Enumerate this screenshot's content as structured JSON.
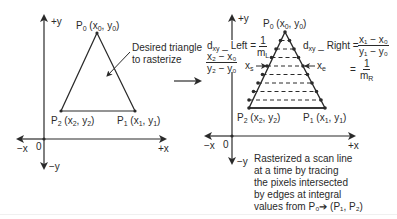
{
  "left_diagram": {
    "axis_labels": {
      "pos_y": "+y",
      "neg_y": "−y",
      "pos_x": "+x",
      "neg_x": "−x",
      "origin": "0"
    },
    "points": {
      "p0": {
        "name": "P",
        "index": "0",
        "coords_prefix": "(x",
        "coords_mid": ", y",
        "coords_suffix": ")"
      },
      "p1": {
        "name": "P",
        "index": "1",
        "coords_prefix": "(x",
        "coords_mid": ", y",
        "coords_suffix": ")"
      },
      "p2": {
        "name": "P",
        "index": "2",
        "coords_prefix": "(x",
        "coords_mid": ", y",
        "coords_suffix": ")"
      }
    },
    "annotation": {
      "line1": "Desired triangle",
      "line2": "to rasterize"
    }
  },
  "right_diagram": {
    "axis_labels": {
      "pos_y": "+y",
      "neg_y": "−y",
      "pos_x": "+x",
      "neg_x": "−x",
      "origin": "0"
    },
    "scan_markers": {
      "start": "x",
      "start_sub": "s",
      "end": "x",
      "end_sub": "e"
    },
    "formula_left": {
      "label": "d",
      "label_sub": "xy",
      "label_rest": " _ Left = ",
      "frac1_num": "1",
      "frac1_den": "m",
      "frac1_den_sub": "L",
      "frac2_num": "x₂ − x₀",
      "frac2_den": "y₂ − y₀"
    },
    "formula_right": {
      "label": "d",
      "label_sub": "xy",
      "label_rest": " _ Right = ",
      "frac1_num": "x₁ − x₀",
      "frac1_den": "y₁ − y₀",
      "eq": "=",
      "frac2_num": "1",
      "frac2_den": "m",
      "frac2_den_sub": "R"
    },
    "caption": [
      "Rasterized a scan line",
      "at a time by tracing",
      "the pixels intersected",
      "by edges at integral",
      "values from P₀➔ (P₁, P₂)"
    ]
  },
  "colors": {
    "ink": "#2a2a2a",
    "background": "#ffffff"
  }
}
